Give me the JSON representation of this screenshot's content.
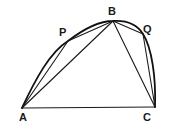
{
  "diagram": {
    "type": "geometry-figure",
    "points": {
      "A": {
        "label": "A",
        "x": 22,
        "y": 108
      },
      "P": {
        "label": "P",
        "x": 68,
        "y": 41
      },
      "B": {
        "label": "B",
        "x": 113,
        "y": 21
      },
      "Q": {
        "label": "Q",
        "x": 143,
        "y": 34
      },
      "C": {
        "label": "C",
        "x": 155,
        "y": 107
      }
    },
    "segments": [
      "AC",
      "AB",
      "BC",
      "AP",
      "PB",
      "BQ",
      "QC"
    ],
    "curve": "arc A-P-B-Q-C",
    "colors": {
      "stroke": "#1a1a1a",
      "background": "#ffffff"
    }
  }
}
